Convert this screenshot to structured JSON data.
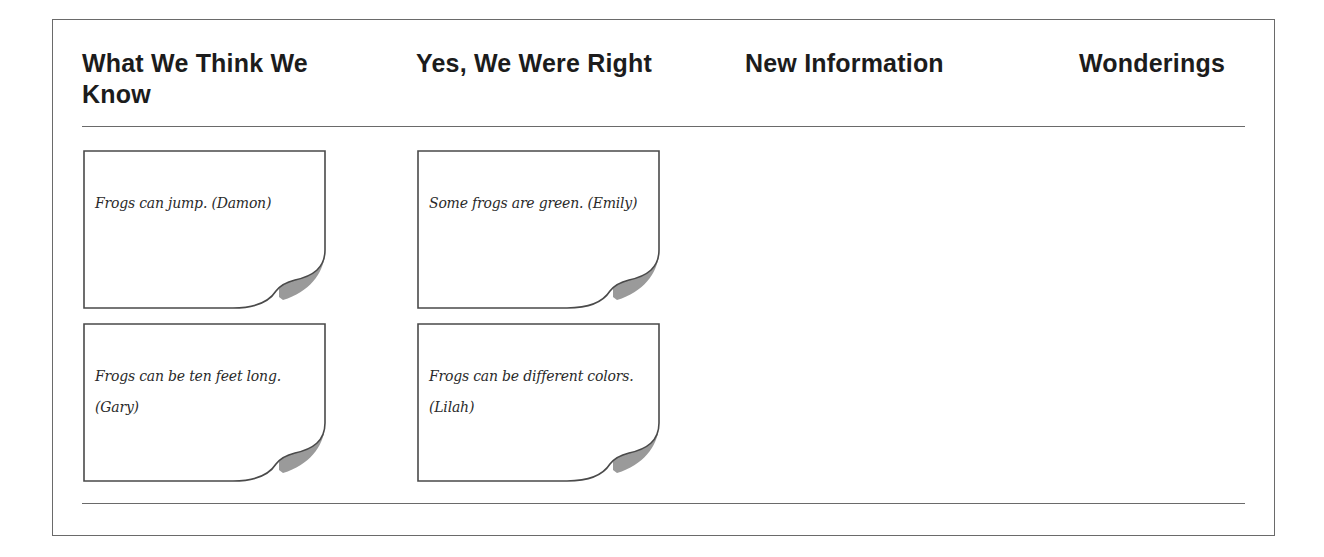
{
  "chart_headers": {
    "columns": [
      {
        "label": "What We Think We Know"
      },
      {
        "label": "Yes, We Were Right"
      },
      {
        "label": "New Information"
      },
      {
        "label": "Wonderings"
      }
    ]
  },
  "notes": [
    {
      "column": "What We Think We Know",
      "text": "Frogs can jump. (Damon)"
    },
    {
      "column": "Yes, We Were Right",
      "text": "Some frogs are green. (Emily)"
    },
    {
      "column": "What We Think We Know",
      "text": "Frogs can be ten feet long. (Gary)"
    },
    {
      "column": "Yes, We Were Right",
      "text": "Frogs can be different colors. (Lilah)"
    }
  ],
  "colors": {
    "border": "#6a6a6a",
    "text": "#1c1c1c",
    "note_background": "#ffffff",
    "curl_shadow": "#9a9a9a"
  }
}
